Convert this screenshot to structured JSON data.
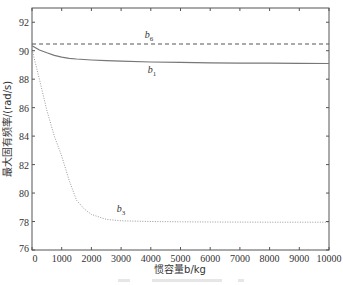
{
  "chart_data": {
    "type": "line",
    "title": "",
    "xlabel": "惯容量b/kg",
    "ylabel": "最大固有频率/(rad/s)",
    "xlim": [
      0,
      10000
    ],
    "ylim": [
      76,
      93
    ],
    "grid": false,
    "legend": "none (inline labels)",
    "x_ticks": [
      0,
      1000,
      2000,
      3000,
      4000,
      5000,
      6000,
      7000,
      8000,
      9000,
      10000
    ],
    "y_ticks": [
      76,
      78,
      80,
      82,
      84,
      86,
      88,
      90,
      92
    ],
    "x": [
      0,
      250,
      500,
      750,
      1000,
      1250,
      1500,
      1750,
      2000,
      2500,
      3000,
      4000,
      5000,
      6000,
      7000,
      8000,
      9000,
      10000
    ],
    "series": [
      {
        "name": "b6",
        "style": "dashed",
        "color": "#555555",
        "values": [
          90.47,
          90.47,
          90.47,
          90.47,
          90.47,
          90.47,
          90.47,
          90.47,
          90.47,
          90.47,
          90.47,
          90.47,
          90.47,
          90.47,
          90.47,
          90.47,
          90.47,
          90.47
        ],
        "label_pos": [
          3800,
          90.9
        ]
      },
      {
        "name": "b1",
        "style": "solid",
        "color": "#777777",
        "values": [
          90.35,
          90.05,
          89.85,
          89.68,
          89.55,
          89.47,
          89.42,
          89.38,
          89.35,
          89.3,
          89.26,
          89.21,
          89.18,
          89.15,
          89.13,
          89.12,
          89.11,
          89.1
        ],
        "label_pos": [
          3900,
          88.4
        ]
      },
      {
        "name": "b3",
        "style": "dotted",
        "color": "#999999",
        "values": [
          90.1,
          88.0,
          85.8,
          84.0,
          82.6,
          80.9,
          79.5,
          78.9,
          78.5,
          78.15,
          78.05,
          78.0,
          77.98,
          77.97,
          77.96,
          77.95,
          77.95,
          77.95
        ],
        "label_pos": [
          2850,
          78.7
        ]
      }
    ]
  },
  "labels": {
    "xlabel": "惯容量b/kg",
    "ylabel": "最大固有频率/(rad/s)",
    "series": [
      {
        "main": "b",
        "sub": "6"
      },
      {
        "main": "b",
        "sub": "1"
      },
      {
        "main": "b",
        "sub": "3"
      }
    ],
    "x_ticks": [
      "0",
      "1000",
      "2000",
      "3000",
      "4000",
      "5000",
      "6000",
      "7000",
      "8000",
      "9000",
      "10000"
    ],
    "y_ticks": [
      "76",
      "78",
      "80",
      "82",
      "84",
      "86",
      "88",
      "90",
      "92"
    ]
  }
}
